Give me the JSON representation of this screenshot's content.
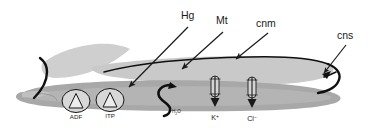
{
  "figure": {
    "name": "epithelial-transport-diagram",
    "callouts": [
      {
        "id": "hg",
        "label": "Hg",
        "x": 186,
        "y": 17
      },
      {
        "id": "mt",
        "label": "Mt",
        "x": 222,
        "y": 22
      },
      {
        "id": "cnm",
        "label": "cnm",
        "x": 267,
        "y": 25
      },
      {
        "id": "cns",
        "label": "cns",
        "x": 343,
        "y": 37
      }
    ],
    "pumps": [
      {
        "id": "adf",
        "label": "ADF",
        "cx": 76,
        "cy": 101
      },
      {
        "id": "itp",
        "label": "ITP",
        "cx": 110,
        "cy": 100
      }
    ],
    "channels": [
      {
        "id": "k",
        "label": "K",
        "superscript": "+",
        "x": 215,
        "y": 92
      },
      {
        "id": "cl",
        "label": "Cl",
        "superscript": "−",
        "x": 252,
        "y": 92
      }
    ],
    "water": {
      "label": "H",
      "subscript": "2",
      "label_tail": "O",
      "x": 178,
      "y": 112
    },
    "colors": {
      "band_light": "#c9c9c9",
      "band_mid": "#bdbdbd",
      "band_dark": "#a8a8a8",
      "flap": "#cfcfcf",
      "ink": "#101010",
      "leader": "#2b2b2b",
      "background": "#ffffff"
    }
  }
}
